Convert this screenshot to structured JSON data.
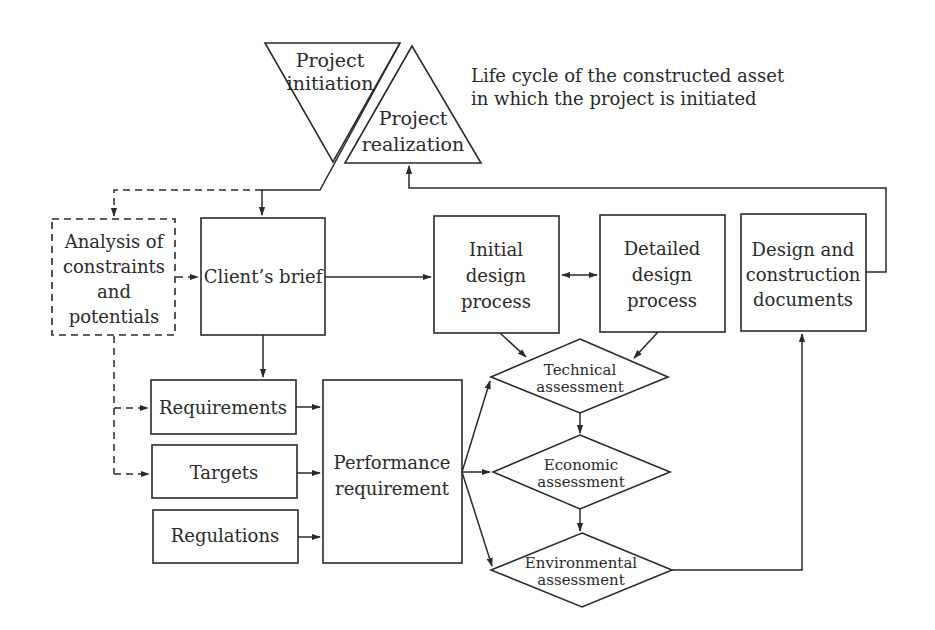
{
  "diagram": {
    "title": "Life cycle of the constructed asset in which the project is initiated",
    "caption": {
      "line1": "Life cycle of the constructed asset",
      "line2": "in which the project is initiated"
    },
    "colors": {
      "stroke": "#2a2a2a",
      "fill": "#ffffff",
      "background": "#ffffff"
    },
    "nodes": {
      "project_initiation": {
        "shape": "inverted-triangle",
        "line1": "Project",
        "line2": "initiation"
      },
      "project_realization": {
        "shape": "triangle",
        "line1": "Project",
        "line2": "realization"
      },
      "analysis": {
        "shape": "dashed-rectangle",
        "line1": "Analysis of",
        "line2": "constraints",
        "line3": "and",
        "line4": "potentials"
      },
      "client_brief": {
        "shape": "rectangle",
        "line1": "Client’s brief"
      },
      "initial_design": {
        "shape": "rectangle",
        "line1": "Initial",
        "line2": "design",
        "line3": "process"
      },
      "detailed_design": {
        "shape": "rectangle",
        "line1": "Detailed",
        "line2": "design",
        "line3": "process"
      },
      "design_docs": {
        "shape": "rectangle",
        "line1": "Design and",
        "line2": "construction",
        "line3": "documents"
      },
      "requirements": {
        "shape": "rectangle",
        "line1": "Requirements"
      },
      "targets": {
        "shape": "rectangle",
        "line1": "Targets"
      },
      "regulations": {
        "shape": "rectangle",
        "line1": "Regulations"
      },
      "performance": {
        "shape": "rectangle",
        "line1": "Performance",
        "line2": "requirement"
      },
      "technical": {
        "shape": "diamond",
        "line1": "Technical",
        "line2": "assessment"
      },
      "economic": {
        "shape": "diamond",
        "line1": "Economic",
        "line2": "assessment"
      },
      "environmental": {
        "shape": "diamond",
        "line1": "Environmental",
        "line2": "assessment"
      }
    },
    "edges": [
      {
        "from": "project_initiation",
        "to": "client_brief",
        "style": "solid"
      },
      {
        "from": "project_initiation",
        "to": "analysis",
        "style": "dashed"
      },
      {
        "from": "analysis",
        "to": "client_brief",
        "style": "dashed"
      },
      {
        "from": "analysis",
        "to": "requirements",
        "style": "dashed"
      },
      {
        "from": "analysis",
        "to": "targets",
        "style": "dashed"
      },
      {
        "from": "client_brief",
        "to": "initial_design",
        "style": "solid"
      },
      {
        "from": "client_brief",
        "to": "requirements",
        "style": "solid"
      },
      {
        "from": "initial_design",
        "to": "detailed_design",
        "style": "bidirectional"
      },
      {
        "from": "initial_design",
        "to": "technical",
        "style": "solid"
      },
      {
        "from": "detailed_design",
        "to": "technical",
        "style": "solid"
      },
      {
        "from": "requirements",
        "to": "performance",
        "style": "solid"
      },
      {
        "from": "targets",
        "to": "performance",
        "style": "solid"
      },
      {
        "from": "regulations",
        "to": "performance",
        "style": "solid"
      },
      {
        "from": "performance",
        "to": "technical",
        "style": "solid"
      },
      {
        "from": "performance",
        "to": "economic",
        "style": "solid"
      },
      {
        "from": "performance",
        "to": "environmental",
        "style": "solid"
      },
      {
        "from": "technical",
        "to": "economic",
        "style": "solid"
      },
      {
        "from": "economic",
        "to": "environmental",
        "style": "solid"
      },
      {
        "from": "environmental",
        "to": "design_docs",
        "style": "solid"
      },
      {
        "from": "design_docs",
        "to": "project_realization",
        "style": "solid"
      }
    ]
  }
}
